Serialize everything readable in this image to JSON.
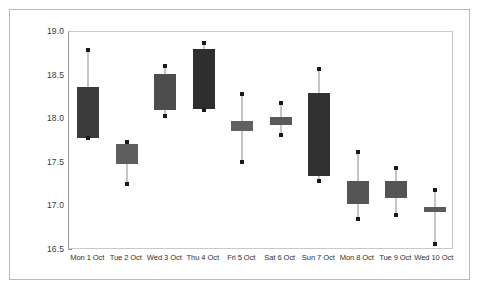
{
  "chart_data": {
    "type": "bar",
    "subtype": "candlestick-ohlc-box",
    "title": "",
    "subtitle": "",
    "xlabel": "",
    "ylabel": "",
    "ylim": [
      16.5,
      19.0
    ],
    "ytick_step": 0.5,
    "ytick_labels": [
      "19.0",
      "18.5",
      "18.0",
      "17.5",
      "17.0",
      "16.5"
    ],
    "ytick_values": [
      19.0,
      18.5,
      18.0,
      17.5,
      17.0,
      16.5
    ],
    "grid": false,
    "legend": null,
    "categories": [
      "Mon 1 Oct",
      "Tue 2 Oct",
      "Wed 3 Oct",
      "Thu 4 Oct",
      "Fri 5 Oct",
      "Sat 6 Oct",
      "Sun 7 Oct",
      "Mon 8 Oct",
      "Tue 9 Oct",
      "Wed 10 Oct"
    ],
    "series": [
      {
        "name": "Price range",
        "points": [
          {
            "category": "Mon 1 Oct",
            "high": 18.79,
            "box_top": 18.37,
            "box_bottom": 17.78,
            "low": 17.78,
            "color": "#3b3b3b"
          },
          {
            "category": "Tue 2 Oct",
            "high": 17.74,
            "box_top": 17.72,
            "box_bottom": 17.49,
            "low": 17.26,
            "color": "#5e5e5e"
          },
          {
            "category": "Wed 3 Oct",
            "high": 18.61,
            "box_top": 18.52,
            "box_bottom": 18.11,
            "low": 18.04,
            "color": "#4d4d4d"
          },
          {
            "category": "Thu 4 Oct",
            "high": 18.87,
            "box_top": 18.81,
            "box_bottom": 18.12,
            "low": 18.1,
            "color": "#2e2e2e"
          },
          {
            "category": "Fri 5 Oct",
            "high": 18.29,
            "box_top": 17.98,
            "box_bottom": 17.86,
            "low": 17.51,
            "color": "#616161"
          },
          {
            "category": "Sat 6 Oct",
            "high": 18.19,
            "box_top": 18.02,
            "box_bottom": 17.93,
            "low": 17.82,
            "color": "#5a5a5a"
          },
          {
            "category": "Sun 7 Oct",
            "high": 18.57,
            "box_top": 18.3,
            "box_bottom": 17.35,
            "low": 17.29,
            "color": "#313131"
          },
          {
            "category": "Mon 8 Oct",
            "high": 17.62,
            "box_top": 17.29,
            "box_bottom": 17.03,
            "low": 16.86,
            "color": "#555555"
          },
          {
            "category": "Tue 9 Oct",
            "high": 17.44,
            "box_top": 17.29,
            "box_bottom": 17.1,
            "low": 16.9,
            "color": "#545454"
          },
          {
            "category": "Wed 10 Oct",
            "high": 17.19,
            "box_top": 16.99,
            "box_bottom": 16.94,
            "low": 16.57,
            "color": "#5b5b5b"
          }
        ]
      }
    ],
    "colors": {
      "wick": "#8b8b8b",
      "cap_marker": "#1a1a1a",
      "axis": "#9a9a9a",
      "frame": "#b9b9b9",
      "tick_label": "#3a3a3a",
      "background": "#ffffff"
    }
  }
}
